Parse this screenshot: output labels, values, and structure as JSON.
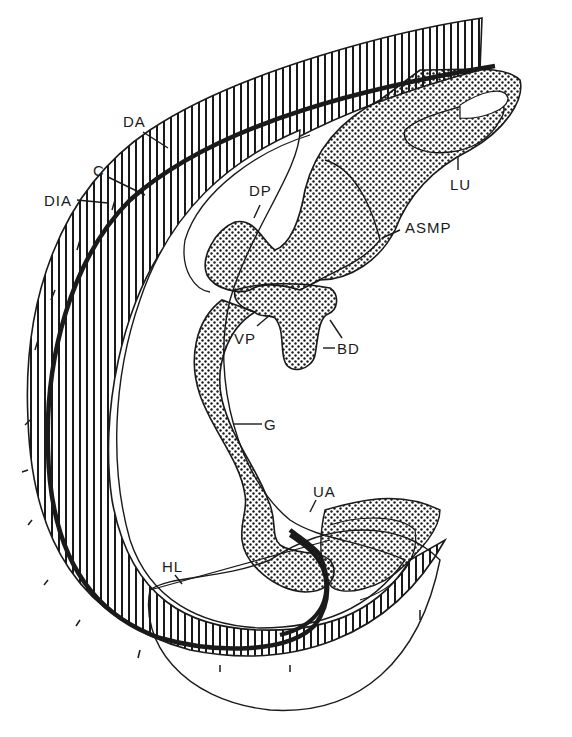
{
  "figure": {
    "type": "anatomical line drawing (embryo schematic)",
    "colors": {
      "ink": "#1a1a1a",
      "background": "#ffffff"
    },
    "fills": {
      "hatched": "vertical line hatching",
      "stippled": "dot stipple"
    }
  },
  "labels": {
    "DA": "DA",
    "C": "C",
    "DIA": "DIA",
    "DP": "DP",
    "LU": "LU",
    "ASMP": "ASMP",
    "VP": "VP",
    "BD": "BD",
    "G": "G",
    "UA": "UA",
    "HL": "HL"
  }
}
